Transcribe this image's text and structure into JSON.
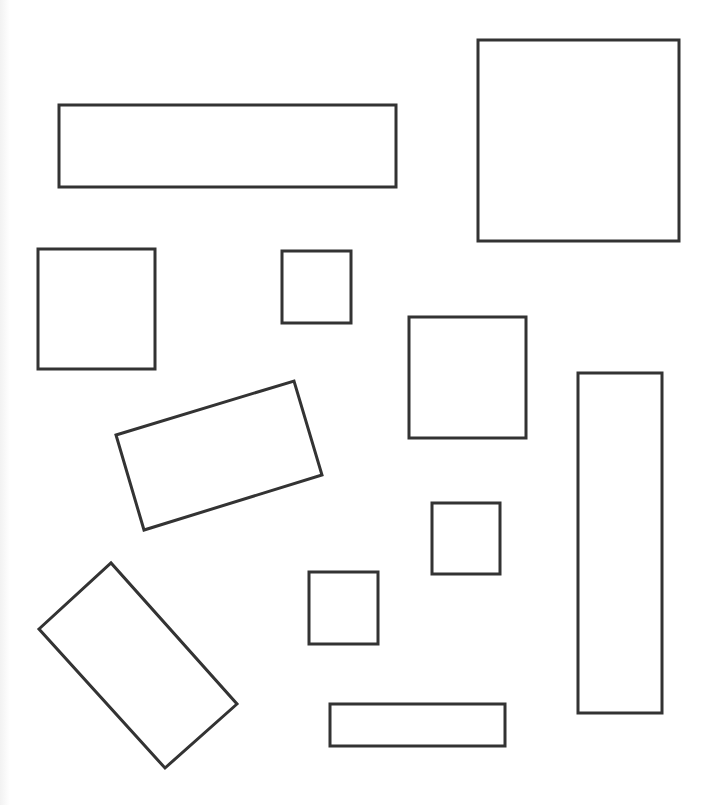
{
  "canvas": {
    "width": 712,
    "height": 805,
    "background": "#ffffff",
    "stroke_color": "#333333",
    "stroke_width": 3
  },
  "shapes": [
    {
      "id": "wide-rect-top",
      "type": "rect",
      "x": 59,
      "y": 105,
      "w": 337,
      "h": 82
    },
    {
      "id": "large-square-top-right",
      "type": "rect",
      "x": 478,
      "y": 40,
      "w": 201,
      "h": 201
    },
    {
      "id": "square-left",
      "type": "rect",
      "x": 38,
      "y": 249,
      "w": 117,
      "h": 120
    },
    {
      "id": "small-square-center",
      "type": "rect",
      "x": 282,
      "y": 251,
      "w": 69,
      "h": 72
    },
    {
      "id": "medium-square-center-right",
      "type": "rect",
      "x": 409,
      "y": 317,
      "w": 117,
      "h": 121
    },
    {
      "id": "tall-rect-right",
      "type": "rect",
      "x": 578,
      "y": 373,
      "w": 84,
      "h": 340
    },
    {
      "id": "tilted-rect-center-left",
      "type": "polygon",
      "points": "116,435 294,381 322,475 144,530"
    },
    {
      "id": "small-square-lower-right",
      "type": "rect",
      "x": 432,
      "y": 503,
      "w": 68,
      "h": 71
    },
    {
      "id": "small-square-lower-center",
      "type": "rect",
      "x": 309,
      "y": 572,
      "w": 69,
      "h": 72
    },
    {
      "id": "tilted-rect-bottom-left",
      "type": "polygon",
      "points": "39,629 111,563 237,704 165,768"
    },
    {
      "id": "flat-rect-bottom",
      "type": "rect",
      "x": 330,
      "y": 704,
      "w": 175,
      "h": 42
    }
  ]
}
